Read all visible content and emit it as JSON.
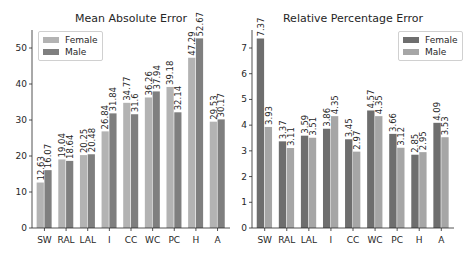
{
  "chart_data": [
    {
      "type": "bar",
      "title": "Mean Absolute Error",
      "xlabel": "",
      "ylabel": "",
      "categories": [
        "SW",
        "RAL",
        "LAL",
        "I",
        "CC",
        "WC",
        "PC",
        "H",
        "A"
      ],
      "series": [
        {
          "name": "Female",
          "color": "#b3b3b3",
          "values": [
            12.63,
            19.04,
            20.25,
            26.84,
            34.77,
            36.26,
            39.18,
            47.29,
            29.53
          ]
        },
        {
          "name": "Male",
          "color": "#7f7f7f",
          "values": [
            16.07,
            18.64,
            20.48,
            31.84,
            31.6,
            37.94,
            32.14,
            52.67,
            30.17
          ]
        }
      ],
      "ylim": [
        0,
        55
      ],
      "yticks": [
        0,
        10,
        20,
        30,
        40,
        50
      ],
      "grid": false,
      "legend_position": "upper left"
    },
    {
      "type": "bar",
      "title": "Relative Percentage Error",
      "xlabel": "",
      "ylabel": "",
      "categories": [
        "SW",
        "RAL",
        "LAL",
        "I",
        "CC",
        "WC",
        "PC",
        "H",
        "A"
      ],
      "series": [
        {
          "name": "Female",
          "color": "#6e6e6e",
          "values": [
            7.37,
            3.37,
            3.59,
            3.86,
            3.45,
            4.57,
            3.66,
            2.85,
            4.09
          ]
        },
        {
          "name": "Male",
          "color": "#a6a6a6",
          "values": [
            3.93,
            3.11,
            3.51,
            4.35,
            2.97,
            4.35,
            3.12,
            2.95,
            3.53
          ]
        }
      ],
      "ylim": [
        0,
        7.7
      ],
      "yticks": [
        0,
        1,
        2,
        3,
        4,
        5,
        6,
        7
      ],
      "grid": false,
      "legend_position": "upper right"
    }
  ]
}
